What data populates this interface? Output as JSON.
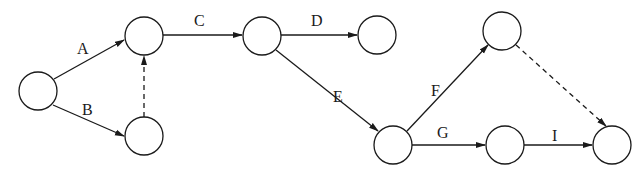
{
  "diagram": {
    "type": "activity-on-arrow network",
    "nodes": [
      {
        "id": "n1",
        "cx": 38,
        "cy": 91
      },
      {
        "id": "n2",
        "cx": 144,
        "cy": 36
      },
      {
        "id": "n3",
        "cx": 144,
        "cy": 136
      },
      {
        "id": "n4",
        "cx": 262,
        "cy": 36
      },
      {
        "id": "n5",
        "cx": 377,
        "cy": 35
      },
      {
        "id": "n6",
        "cx": 502,
        "cy": 31
      },
      {
        "id": "n7",
        "cx": 393,
        "cy": 145
      },
      {
        "id": "n8",
        "cx": 505,
        "cy": 145
      },
      {
        "id": "n9",
        "cx": 612,
        "cy": 145
      }
    ],
    "node_radius": 19,
    "edges": [
      {
        "id": "A",
        "label": "A",
        "from": "n1",
        "to": "n2",
        "dashed": false
      },
      {
        "id": "B",
        "label": "B",
        "from": "n1",
        "to": "n3",
        "dashed": false
      },
      {
        "id": "dummy1",
        "label": "",
        "from": "n3",
        "to": "n2",
        "dashed": true
      },
      {
        "id": "C",
        "label": "C",
        "from": "n2",
        "to": "n4",
        "dashed": false
      },
      {
        "id": "D",
        "label": "D",
        "from": "n4",
        "to": "n5",
        "dashed": false
      },
      {
        "id": "E",
        "label": "E",
        "from": "n4",
        "to": "n7",
        "dashed": false
      },
      {
        "id": "F",
        "label": "F",
        "from": "n7",
        "to": "n6",
        "dashed": false
      },
      {
        "id": "G",
        "label": "G",
        "from": "n7",
        "to": "n8",
        "dashed": false
      },
      {
        "id": "dummy2",
        "label": "",
        "from": "n6",
        "to": "n9",
        "dashed": true
      },
      {
        "id": "I",
        "label": "I",
        "from": "n8",
        "to": "n9",
        "dashed": false
      }
    ],
    "labels": {
      "A": "A",
      "B": "B",
      "C": "C",
      "D": "D",
      "E": "E",
      "F": "F",
      "G": "G",
      "I": "I"
    }
  }
}
